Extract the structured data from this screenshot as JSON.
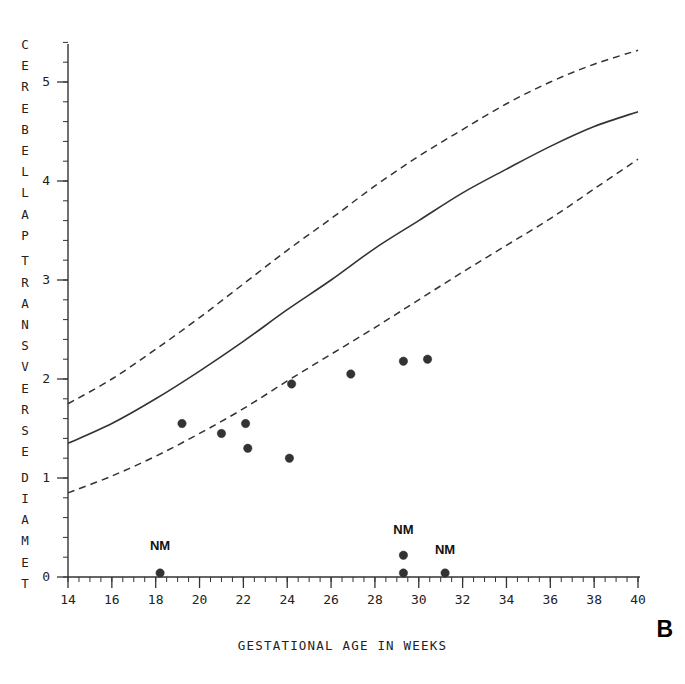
{
  "panel": {
    "letter": "B"
  },
  "axes": {
    "x_title": "GESTATIONAL AGE IN WEEKS",
    "y_title_letters": [
      "C",
      "E",
      "R",
      "E",
      "B",
      "E",
      "L",
      "L",
      "A",
      "P",
      "",
      "T",
      "R",
      "A",
      "N",
      "S",
      "V",
      "E",
      "R",
      "S",
      "E",
      "",
      "D",
      "I",
      "A",
      "M",
      "E",
      "T"
    ],
    "y_title_text": "CEREBELLAP TRANSVERSE DIAMET",
    "x_ticks": [
      "14",
      "16",
      "18",
      "20",
      "22",
      "24",
      "26",
      "28",
      "30",
      "32",
      "34",
      "36",
      "38",
      "40"
    ],
    "y_ticks": [
      "0",
      "1",
      "2",
      "3",
      "4",
      "5"
    ]
  },
  "annotations": [
    {
      "text": "NM",
      "x": 18.2,
      "y": 0.3
    },
    {
      "text": "NM",
      "x": 29.3,
      "y": 0.46
    },
    {
      "text": "NM",
      "x": 31.2,
      "y": 0.26
    }
  ],
  "chart_data": {
    "type": "scatter",
    "title": "",
    "xlabel": "GESTATIONAL AGE IN WEEKS",
    "ylabel": "CEREBELLAR TRANSVERSE DIAMETER",
    "xlim": [
      14,
      40
    ],
    "ylim": [
      0,
      5.4
    ],
    "xticks": [
      14,
      16,
      18,
      20,
      22,
      24,
      26,
      28,
      30,
      32,
      34,
      36,
      38,
      40
    ],
    "yticks": [
      0,
      1,
      2,
      3,
      4,
      5
    ],
    "minor_tick_interval_x": 0.5,
    "minor_tick_interval_y": 0.2,
    "grid": false,
    "legend": null,
    "series": [
      {
        "name": "Patient measurements",
        "type": "scatter",
        "marker": "filled-circle",
        "color": "#333333",
        "points": [
          {
            "x": 19.2,
            "y": 1.55
          },
          {
            "x": 21.0,
            "y": 1.45
          },
          {
            "x": 22.1,
            "y": 1.55
          },
          {
            "x": 22.2,
            "y": 1.3
          },
          {
            "x": 24.1,
            "y": 1.2
          },
          {
            "x": 24.2,
            "y": 1.95
          },
          {
            "x": 26.9,
            "y": 2.05
          },
          {
            "x": 29.3,
            "y": 2.18
          },
          {
            "x": 30.4,
            "y": 2.2
          }
        ]
      },
      {
        "name": "Not measured (NM)",
        "type": "scatter",
        "marker": "filled-circle",
        "color": "#333333",
        "points": [
          {
            "x": 18.2,
            "y": 0.04
          },
          {
            "x": 29.3,
            "y": 0.22
          },
          {
            "x": 29.3,
            "y": 0.04
          },
          {
            "x": 31.2,
            "y": 0.04
          }
        ]
      },
      {
        "name": "95th percentile",
        "type": "line",
        "style": "dashed",
        "color": "#333333",
        "x": [
          14,
          16,
          18,
          20,
          22,
          24,
          26,
          28,
          30,
          32,
          34,
          36,
          38,
          40
        ],
        "y": [
          1.75,
          2.0,
          2.3,
          2.62,
          2.96,
          3.3,
          3.62,
          3.95,
          4.25,
          4.52,
          4.78,
          5.0,
          5.18,
          5.32
        ]
      },
      {
        "name": "50th percentile",
        "type": "line",
        "style": "solid",
        "color": "#333333",
        "x": [
          14,
          16,
          18,
          20,
          22,
          24,
          26,
          28,
          30,
          32,
          34,
          36,
          38,
          40
        ],
        "y": [
          1.35,
          1.55,
          1.8,
          2.08,
          2.38,
          2.7,
          3.0,
          3.32,
          3.6,
          3.88,
          4.12,
          4.35,
          4.55,
          4.7
        ]
      },
      {
        "name": "5th percentile",
        "type": "line",
        "style": "dashed",
        "color": "#333333",
        "x": [
          14,
          16,
          18,
          20,
          22,
          24,
          26,
          28,
          30,
          32,
          34,
          36,
          38,
          40
        ],
        "y": [
          0.85,
          1.02,
          1.22,
          1.45,
          1.7,
          1.98,
          2.25,
          2.52,
          2.8,
          3.08,
          3.35,
          3.62,
          3.92,
          4.22
        ]
      }
    ]
  }
}
